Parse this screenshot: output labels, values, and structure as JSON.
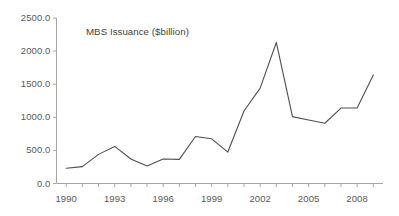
{
  "chart_data": {
    "type": "line",
    "title": "MBS Issuance ($billion)",
    "xlabel": "",
    "ylabel": "",
    "xlim": [
      1989.4,
      2009.6
    ],
    "ylim": [
      0,
      2500
    ],
    "grid": false,
    "legend": "none",
    "y_ticks": [
      "0.0",
      "500.0",
      "1000.0",
      "1500.0",
      "2000.0",
      "2500.0"
    ],
    "y_tick_values": [
      0,
      500,
      1000,
      1500,
      2000,
      2500
    ],
    "x_ticks": [
      "1990",
      "1993",
      "1996",
      "1999",
      "2002",
      "2005",
      "2008"
    ],
    "x_tick_values": [
      1990,
      1993,
      1996,
      1999,
      2002,
      2005,
      2008
    ],
    "x": [
      1990,
      1991,
      1992,
      1993,
      1994,
      1995,
      1996,
      1997,
      1998,
      1999,
      2000,
      2001,
      2002,
      2003,
      2004,
      2005,
      2006,
      2007,
      2008,
      2009
    ],
    "values": [
      230,
      255,
      440,
      560,
      370,
      265,
      370,
      365,
      710,
      675,
      475,
      1095,
      1440,
      2130,
      1010,
      960,
      910,
      1140,
      1140,
      1640
    ],
    "series": [
      {
        "name": "MBS Issuance",
        "color": "#4f4f4f",
        "values": [
          230,
          255,
          440,
          560,
          370,
          265,
          370,
          365,
          710,
          675,
          475,
          1095,
          1440,
          2130,
          1010,
          960,
          910,
          1140,
          1140,
          1640
        ]
      }
    ]
  },
  "axes": {
    "axis_color": "#a6a6a6",
    "line_color": "#4f4f4f",
    "tick_text_color": "#595959",
    "title_color": "#3f3f3f",
    "background": "#ffffff"
  }
}
